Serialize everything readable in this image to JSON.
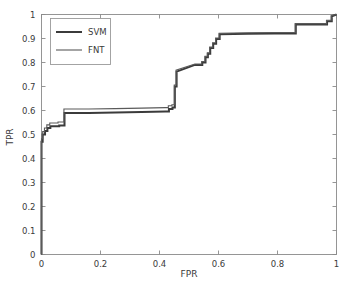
{
  "chart_data": {
    "type": "line",
    "title": "",
    "subtitle": "",
    "xlabel": "FPR",
    "ylabel": "TPR",
    "xlim": [
      0,
      1
    ],
    "ylim": [
      0,
      1
    ],
    "grid": false,
    "legend_position": "upper-left",
    "xticks": [
      0,
      0.2,
      0.4,
      0.6,
      0.8,
      1
    ],
    "xtick_labels": [
      "0",
      "0.2",
      "0.4",
      "0.6",
      "0.8",
      "1"
    ],
    "yticks": [
      0,
      0.1,
      0.2,
      0.3,
      0.4,
      0.5,
      0.6,
      0.7,
      0.8,
      0.9,
      1
    ],
    "ytick_labels": [
      "0",
      "0.1",
      "0.2",
      "0.3",
      "0.4",
      "0.5",
      "0.6",
      "0.7",
      "0.8",
      "0.9",
      "1"
    ],
    "series": [
      {
        "name": "SVM",
        "color": "#3b3b3b",
        "line_width": 2.0,
        "x": [
          0,
          0,
          0.004,
          0.004,
          0.012,
          0.012,
          0.02,
          0.02,
          0.03,
          0.03,
          0.044,
          0.044,
          0.06,
          0.06,
          0.078,
          0.078,
          0.16,
          0.25,
          0.34,
          0.42,
          0.432,
          0.432,
          0.444,
          0.444,
          0.452,
          0.452,
          0.458,
          0.458,
          0.52,
          0.545,
          0.545,
          0.556,
          0.556,
          0.564,
          0.564,
          0.572,
          0.572,
          0.582,
          0.582,
          0.592,
          0.592,
          0.604,
          0.604,
          0.7,
          0.79,
          0.862,
          0.862,
          0.94,
          0.968,
          0.968,
          0.984,
          0.984,
          1.0
        ],
        "y": [
          0,
          0.47,
          0.47,
          0.5,
          0.5,
          0.515,
          0.515,
          0.527,
          0.527,
          0.534,
          0.534,
          0.534,
          0.534,
          0.538,
          0.538,
          0.59,
          0.59,
          0.592,
          0.594,
          0.596,
          0.596,
          0.606,
          0.606,
          0.612,
          0.612,
          0.7,
          0.7,
          0.762,
          0.79,
          0.79,
          0.8,
          0.8,
          0.822,
          0.822,
          0.836,
          0.836,
          0.86,
          0.86,
          0.878,
          0.878,
          0.898,
          0.898,
          0.918,
          0.92,
          0.921,
          0.921,
          0.958,
          0.958,
          0.958,
          0.972,
          0.972,
          0.992,
          1.0
        ]
      },
      {
        "name": "FNT",
        "color": "#5a5a5a",
        "line_width": 1.1,
        "x": [
          0,
          0,
          0.004,
          0.004,
          0.01,
          0.01,
          0.018,
          0.018,
          0.028,
          0.028,
          0.04,
          0.04,
          0.056,
          0.056,
          0.076,
          0.076,
          0.16,
          0.25,
          0.34,
          0.42,
          0.43,
          0.43,
          0.442,
          0.442,
          0.45,
          0.45,
          0.456,
          0.456,
          0.52,
          0.543,
          0.543,
          0.554,
          0.554,
          0.562,
          0.562,
          0.57,
          0.57,
          0.58,
          0.58,
          0.59,
          0.59,
          0.602,
          0.602,
          0.7,
          0.79,
          0.86,
          0.86,
          0.94,
          0.966,
          0.966,
          0.982,
          0.982,
          1.0
        ],
        "y": [
          0,
          0.482,
          0.482,
          0.512,
          0.512,
          0.527,
          0.527,
          0.54,
          0.54,
          0.548,
          0.548,
          0.548,
          0.548,
          0.552,
          0.552,
          0.606,
          0.606,
          0.608,
          0.61,
          0.612,
          0.612,
          0.62,
          0.62,
          0.624,
          0.624,
          0.706,
          0.706,
          0.768,
          0.794,
          0.794,
          0.804,
          0.804,
          0.826,
          0.826,
          0.84,
          0.84,
          0.864,
          0.864,
          0.882,
          0.882,
          0.902,
          0.902,
          0.922,
          0.924,
          0.925,
          0.925,
          0.962,
          0.962,
          0.962,
          0.976,
          0.976,
          0.996,
          1.0
        ]
      }
    ]
  },
  "legend": {
    "entries": [
      {
        "label": "SVM"
      },
      {
        "label": "FNT"
      }
    ]
  },
  "axes": {
    "x_title": "FPR",
    "y_title": "TPR"
  }
}
